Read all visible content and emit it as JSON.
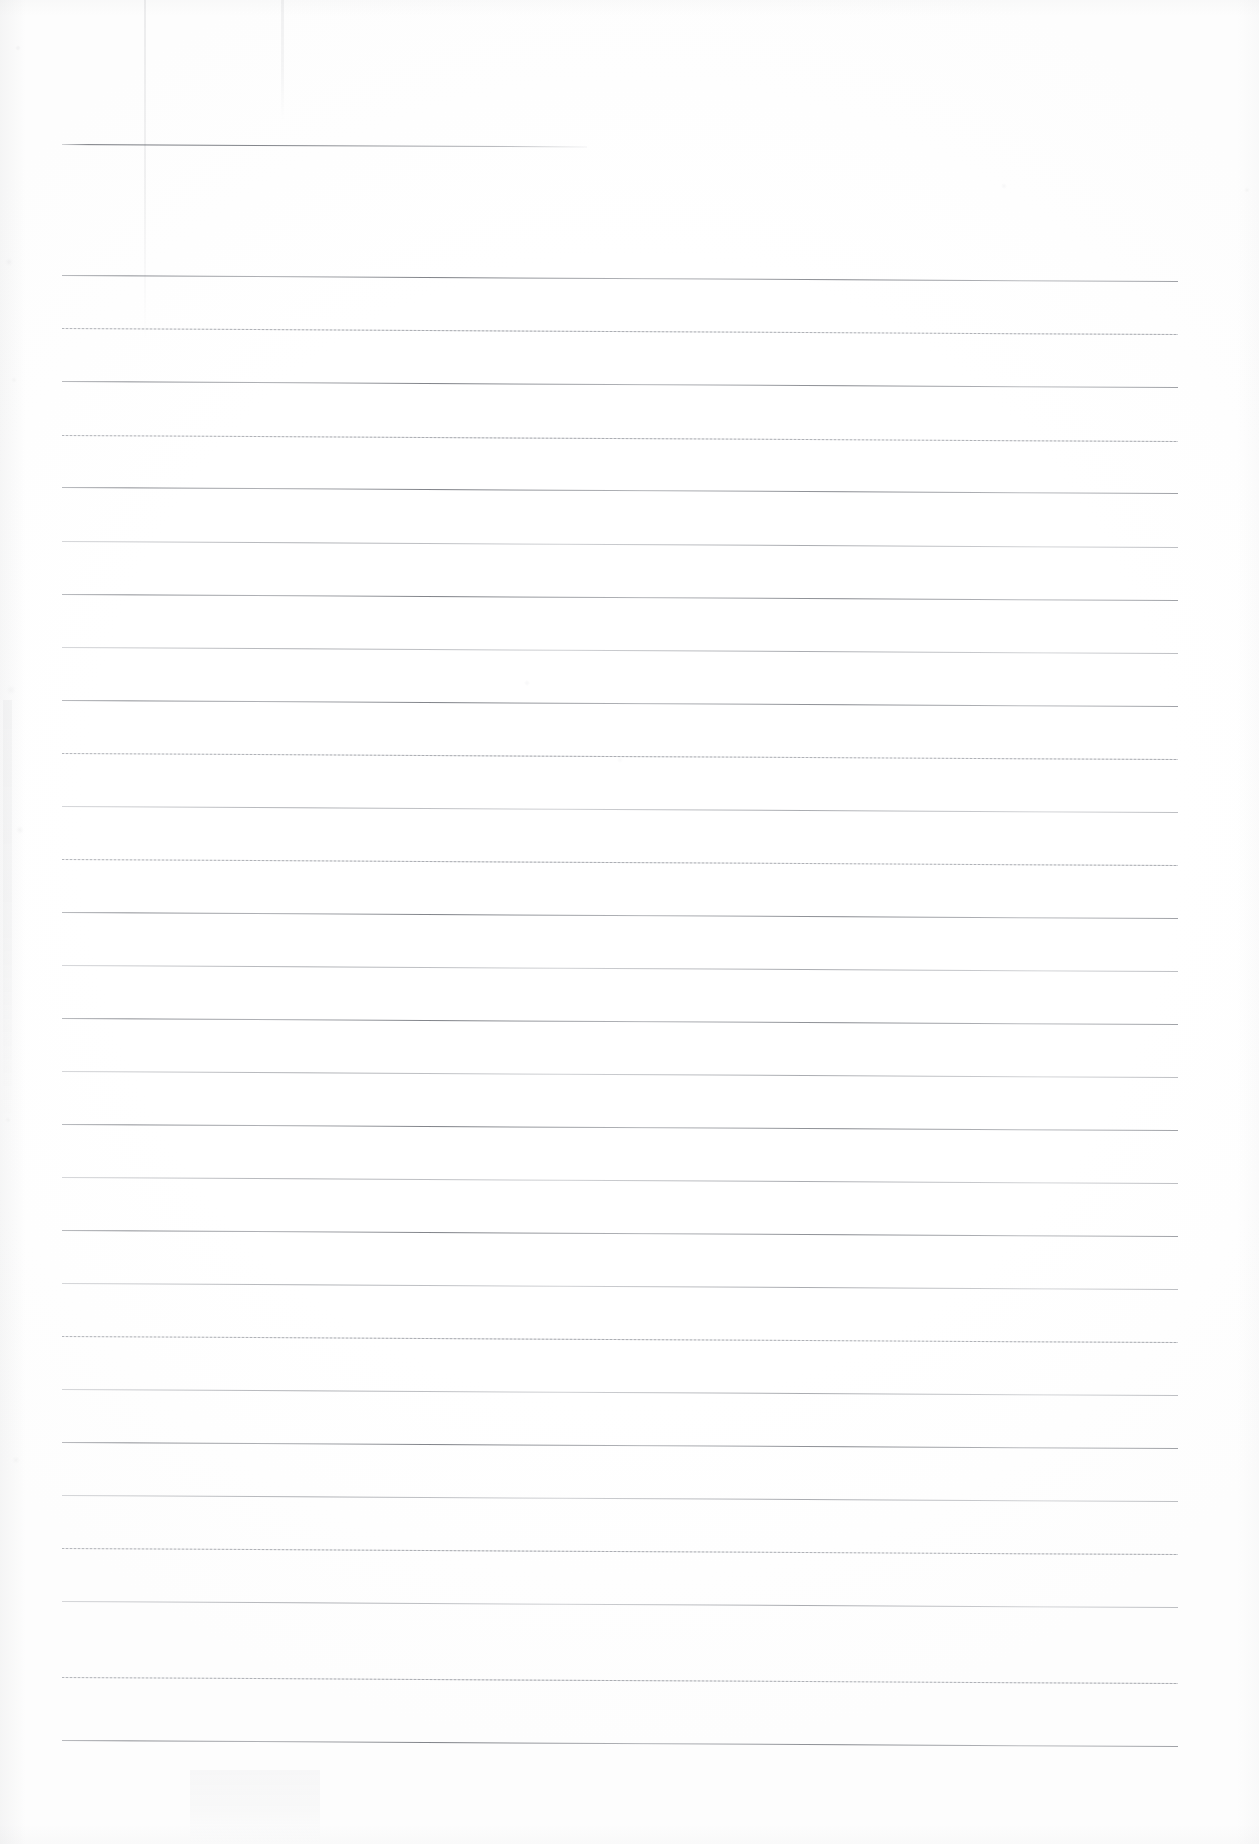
{
  "document": {
    "kind": "scanned-lined-paper",
    "title": "Blank Ruled Notebook Page",
    "page_label": "",
    "visible_text": "",
    "note": "No handwriting, print, headings, numbers or captions are present anywhere on the sheet."
  },
  "canvas": {
    "width": 1259,
    "height": 1844,
    "paper_color": "#ffffff",
    "edge_shadow_color": "#aaacb0"
  },
  "ruling": {
    "ink_color": "#70737a",
    "faint_ink_color": "#9c9fa6",
    "line_left_x": 62,
    "line_right_x": 1178,
    "line_thickness": 1,
    "line_spacing": 53.3,
    "slope_px_over_run": 6,
    "first_line_y": 275,
    "line_count": 27,
    "lines": [
      {
        "y": 275,
        "weight": "solid"
      },
      {
        "y": 328,
        "weight": "faint"
      },
      {
        "y": 381,
        "weight": "solid"
      },
      {
        "y": 435,
        "weight": "faint"
      },
      {
        "y": 487,
        "weight": "solid"
      },
      {
        "y": 541,
        "weight": "mid"
      },
      {
        "y": 594,
        "weight": "solid"
      },
      {
        "y": 647,
        "weight": "mid"
      },
      {
        "y": 700,
        "weight": "solid"
      },
      {
        "y": 753,
        "weight": "faint"
      },
      {
        "y": 806,
        "weight": "mid"
      },
      {
        "y": 859,
        "weight": "faint"
      },
      {
        "y": 912,
        "weight": "solid"
      },
      {
        "y": 965,
        "weight": "mid"
      },
      {
        "y": 1018,
        "weight": "solid"
      },
      {
        "y": 1071,
        "weight": "mid"
      },
      {
        "y": 1124,
        "weight": "solid"
      },
      {
        "y": 1177,
        "weight": "mid"
      },
      {
        "y": 1230,
        "weight": "solid"
      },
      {
        "y": 1283,
        "weight": "mid"
      },
      {
        "y": 1336,
        "weight": "faint"
      },
      {
        "y": 1389,
        "weight": "mid"
      },
      {
        "y": 1442,
        "weight": "solid"
      },
      {
        "y": 1495,
        "weight": "mid"
      },
      {
        "y": 1548,
        "weight": "faint"
      },
      {
        "y": 1601,
        "weight": "mid"
      },
      {
        "y": 1677,
        "weight": "faint"
      },
      {
        "y": 1740,
        "weight": "solid"
      }
    ]
  },
  "header_rule": {
    "x": 62,
    "y": 144,
    "width": 525,
    "description": "short ruled line near top of sheet, stops about 43% across the page"
  },
  "streaks": [
    {
      "name": "fold-crease",
      "x": 144,
      "y": 0,
      "width": 2,
      "height": 340,
      "opacity": 0.16
    },
    {
      "name": "roller-streak",
      "x": 281,
      "y": 0,
      "width": 3,
      "height": 120,
      "opacity": 0.12
    },
    {
      "name": "edge-smudge-left",
      "x": 3,
      "y": 700,
      "width": 9,
      "height": 420,
      "opacity": 0.07
    },
    {
      "name": "bottom-shadow",
      "x": 190,
      "y": 1770,
      "width": 130,
      "height": 74,
      "opacity": 0.06
    }
  ]
}
